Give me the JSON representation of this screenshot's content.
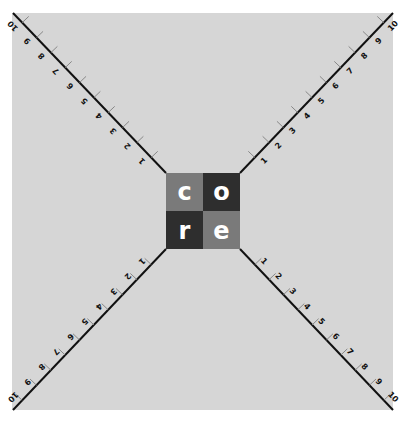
{
  "diagram": {
    "background_color": "#d6d6d6",
    "axis_color": "#111111",
    "center_logo": {
      "letters": [
        "c",
        "o",
        "r",
        "e"
      ],
      "cell_colors": [
        "#7a7a7a",
        "#2e2e2e",
        "#2e2e2e",
        "#7a7a7a"
      ],
      "letter_color": "#ffffff"
    },
    "axes": [
      {
        "name": "top-left",
        "ticks": [
          "1",
          "2",
          "3",
          "4",
          "5",
          "6",
          "7",
          "8",
          "9",
          "10"
        ]
      },
      {
        "name": "top-right",
        "ticks": [
          "1",
          "2",
          "3",
          "4",
          "5",
          "6",
          "7",
          "8",
          "9",
          "10"
        ]
      },
      {
        "name": "bottom-left",
        "ticks": [
          "1",
          "2",
          "3",
          "4",
          "5",
          "6",
          "7",
          "8",
          "9",
          "10"
        ]
      },
      {
        "name": "bottom-right",
        "ticks": [
          "1",
          "2",
          "3",
          "4",
          "5",
          "6",
          "7",
          "8",
          "9",
          "10"
        ]
      }
    ]
  }
}
